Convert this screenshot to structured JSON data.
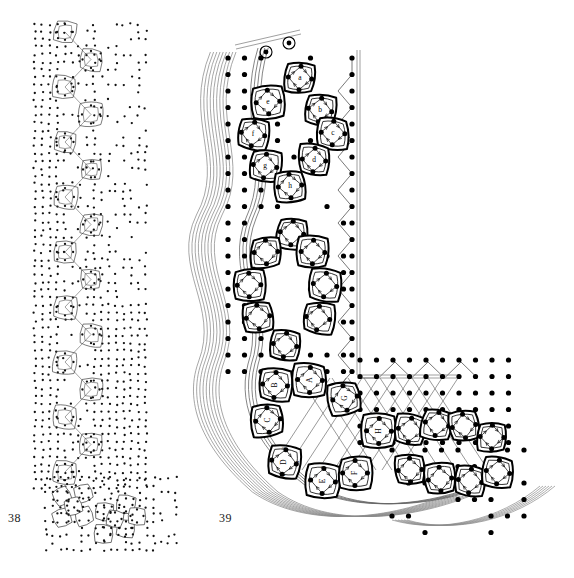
{
  "plate": {
    "background": "#ffffff",
    "ink": "#000000",
    "secondary_ink": "#555555",
    "width": 574,
    "height": 578
  },
  "figures": [
    {
      "id": "fig38",
      "number": "38",
      "caption_position": "bottom-left",
      "description": "Small-scale L-shaped lattice of rounded-square cells with dense dot field",
      "scale": "small",
      "arm_vertical": {
        "x": 78,
        "y_top": 30,
        "y_bottom": 470,
        "cell_count": 18
      },
      "arm_horizontal": {
        "y": 505,
        "x_left": 55,
        "x_right": 150,
        "cell_count": 4
      }
    },
    {
      "id": "fig39",
      "number": "39",
      "caption_position": "bottom-left",
      "description": "Large-scale L-shaped lattice of rounded-square cells, labelled cells, streamlines and dot field",
      "scale": "large",
      "circled_markers": 2,
      "boundary_lines": [
        "vertical double line right",
        "horizontal double line lower"
      ]
    }
  ],
  "fig39_cells_upper": [
    {
      "label": "a",
      "cx": 300,
      "cy": 78
    },
    {
      "label": "b",
      "cx": 320,
      "cy": 110
    },
    {
      "label": "c",
      "cx": 333,
      "cy": 133
    },
    {
      "label": "d",
      "cx": 314,
      "cy": 160
    },
    {
      "label": "e",
      "cx": 268,
      "cy": 102
    },
    {
      "label": "f",
      "cx": 253,
      "cy": 134
    },
    {
      "label": "g",
      "cx": 265,
      "cy": 166
    },
    {
      "label": "h",
      "cx": 290,
      "cy": 186
    }
  ],
  "fig39_cells_middle": [
    {
      "label": "i",
      "cx": 292,
      "cy": 233
    },
    {
      "label": "j",
      "cx": 266,
      "cy": 252
    },
    {
      "label": "k",
      "cx": 313,
      "cy": 252
    },
    {
      "label": "l",
      "cx": 249,
      "cy": 285
    },
    {
      "label": "m",
      "cx": 325,
      "cy": 285
    },
    {
      "label": "n",
      "cx": 258,
      "cy": 317
    },
    {
      "label": "o",
      "cx": 318,
      "cy": 318
    },
    {
      "label": "p",
      "cx": 285,
      "cy": 345
    }
  ],
  "fig39_cells_lower": [
    {
      "label": "A",
      "cx": 310,
      "cy": 380,
      "vertices": [
        "1",
        "2",
        "3",
        "4"
      ]
    },
    {
      "label": "B",
      "cx": 275,
      "cy": 385,
      "vertices": [
        "1",
        "2",
        "3",
        "4"
      ]
    },
    {
      "label": "C",
      "cx": 268,
      "cy": 420,
      "vertices": [
        "1",
        "2",
        "3",
        "4"
      ]
    },
    {
      "label": "D",
      "cx": 284,
      "cy": 462,
      "vertices": [
        "1",
        "2",
        "3",
        "4"
      ]
    },
    {
      "label": "E",
      "cx": 323,
      "cy": 481,
      "vertices": [
        "1",
        "2",
        "3",
        "4"
      ]
    },
    {
      "label": "F",
      "cx": 355,
      "cy": 473,
      "vertices": [
        "1",
        "2",
        "3",
        "4"
      ]
    },
    {
      "label": "G",
      "cx": 345,
      "cy": 398,
      "vertices": [
        "1",
        "2",
        "3",
        "4"
      ]
    },
    {
      "label": "H",
      "cx": 379,
      "cy": 431,
      "vertices": [
        "1",
        "2",
        "3",
        "4"
      ]
    }
  ],
  "fig39_cells_rightarm": [
    {
      "cx": 410,
      "cy": 430
    },
    {
      "cx": 437,
      "cy": 424
    },
    {
      "cx": 464,
      "cy": 426
    },
    {
      "cx": 492,
      "cy": 437
    },
    {
      "cx": 410,
      "cy": 470
    },
    {
      "cx": 440,
      "cy": 479
    },
    {
      "cx": 470,
      "cy": 481
    },
    {
      "cx": 498,
      "cy": 472
    }
  ],
  "fig38_small_clusters": [
    {
      "id": "cluster-left",
      "cx": 72,
      "cy": 505
    },
    {
      "id": "cluster-right",
      "cx": 113,
      "cy": 511
    }
  ],
  "notes": {
    "dot_radius_large": 2.6,
    "dot_radius_small": 1.1,
    "cell_stroke_width": 1.6
  }
}
